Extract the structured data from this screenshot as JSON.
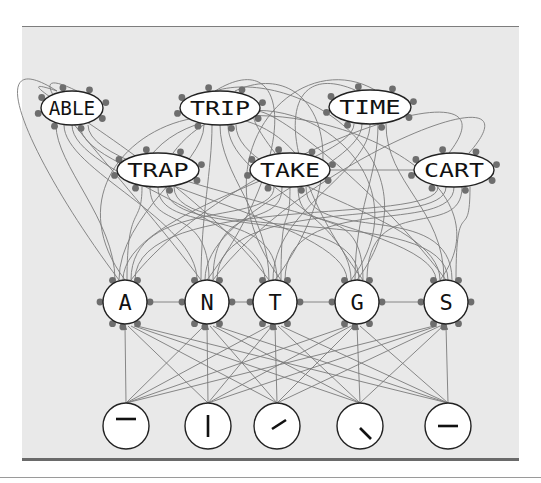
{
  "diagram": {
    "colors": {
      "panel_bg": "#e9e9e9",
      "node_fill": "#ffffff",
      "node_stroke": "#222222",
      "edge": "#777777",
      "connector_dot": "#6e6e6e"
    },
    "word_layer": {
      "nodes": [
        {
          "id": "able",
          "label": "ABLE",
          "cx": 72,
          "cy": 108,
          "rx": 31,
          "ry": 17
        },
        {
          "id": "trip",
          "label": "TRIP",
          "cx": 220,
          "cy": 108,
          "rx": 40,
          "ry": 17
        },
        {
          "id": "time",
          "label": "TIME",
          "cx": 370,
          "cy": 107,
          "rx": 41,
          "ry": 17
        },
        {
          "id": "trap",
          "label": "TRAP",
          "cx": 158,
          "cy": 170,
          "rx": 41,
          "ry": 17
        },
        {
          "id": "take",
          "label": "TAKE",
          "cx": 290,
          "cy": 170,
          "rx": 40,
          "ry": 17
        },
        {
          "id": "cart",
          "label": "CART",
          "cx": 454,
          "cy": 170,
          "rx": 40,
          "ry": 17
        }
      ]
    },
    "letter_layer": {
      "nodes": [
        {
          "id": "A",
          "label": "A",
          "cx": 125,
          "cy": 302,
          "r": 22
        },
        {
          "id": "N",
          "label": "N",
          "cx": 207,
          "cy": 302,
          "r": 22
        },
        {
          "id": "T",
          "label": "T",
          "cx": 275,
          "cy": 302,
          "r": 22
        },
        {
          "id": "G",
          "label": "G",
          "cx": 357,
          "cy": 302,
          "r": 22
        },
        {
          "id": "S",
          "label": "S",
          "cx": 446,
          "cy": 302,
          "r": 22
        }
      ]
    },
    "feature_layer": {
      "nodes": [
        {
          "id": "f1",
          "glyph": "horizontal-top",
          "cx": 126,
          "cy": 426,
          "r": 23
        },
        {
          "id": "f2",
          "glyph": "vertical",
          "cx": 208,
          "cy": 426,
          "r": 23
        },
        {
          "id": "f3",
          "glyph": "diagonal-up",
          "cx": 277,
          "cy": 426,
          "r": 23
        },
        {
          "id": "f4",
          "glyph": "diagonal-down",
          "cx": 360,
          "cy": 426,
          "r": 23
        },
        {
          "id": "f5",
          "glyph": "horizontal-middle",
          "cx": 448,
          "cy": 426,
          "r": 23
        }
      ]
    }
  }
}
